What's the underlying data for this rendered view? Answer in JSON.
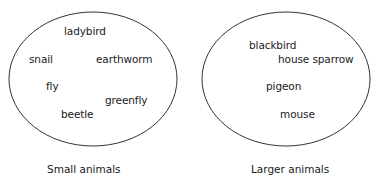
{
  "groups": [
    {
      "caption": "Small animals",
      "items": [
        {
          "label": "ladybird",
          "x": 64,
          "y": 25
        },
        {
          "label": "snail",
          "x": 29,
          "y": 53
        },
        {
          "label": "earthworm",
          "x": 96,
          "y": 53
        },
        {
          "label": "fly",
          "x": 46,
          "y": 80
        },
        {
          "label": "greenfly",
          "x": 105,
          "y": 94
        },
        {
          "label": "beetle",
          "x": 61,
          "y": 108
        }
      ]
    },
    {
      "caption": "Larger animals",
      "items": [
        {
          "label": "blackbird",
          "x": 249,
          "y": 39
        },
        {
          "label": "house sparrow",
          "x": 278,
          "y": 53
        },
        {
          "label": "pigeon",
          "x": 266,
          "y": 80
        },
        {
          "label": "mouse",
          "x": 280,
          "y": 108
        }
      ]
    }
  ],
  "colors": {
    "stroke": "#333333",
    "text": "#1a1a1a"
  }
}
